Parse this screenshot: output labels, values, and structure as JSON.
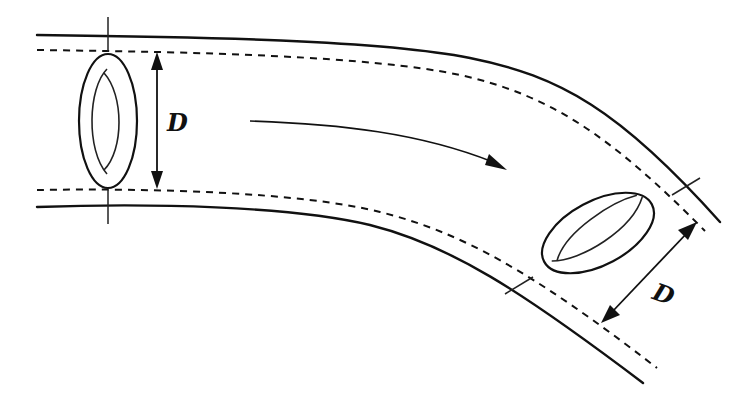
{
  "diagram": {
    "type": "curved-pipe-flow",
    "labels": {
      "left_diameter": "D",
      "right_diameter": "D"
    },
    "elements": {
      "outer_wall_top": "solid line",
      "outer_wall_bottom": "solid line",
      "inner_boundary_top": "dashed line",
      "inner_boundary_bottom": "dashed line",
      "left_cross_section": "ring (vertical ellipse)",
      "right_cross_section": "ring (tilted ellipse)",
      "flow_direction": "curved arrow pointing downstream (right, into bend)"
    },
    "colors": {
      "stroke": "#111111",
      "background": "#ffffff"
    }
  }
}
